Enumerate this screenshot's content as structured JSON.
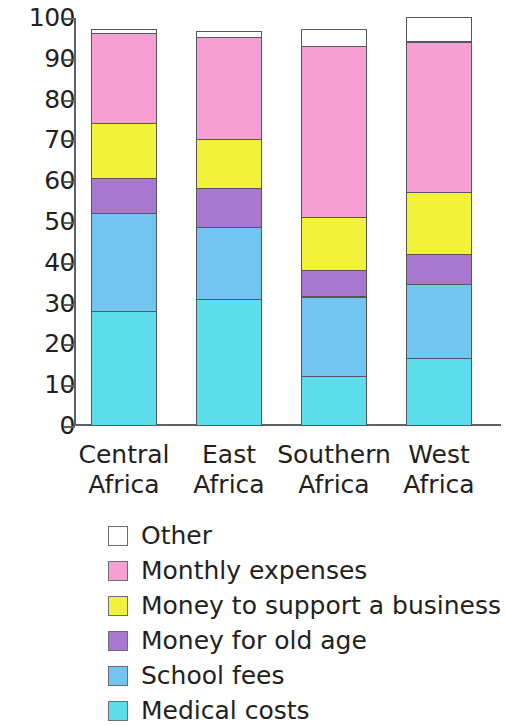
{
  "chart_data": {
    "type": "bar",
    "subtype": "stacked-bar",
    "title": "",
    "xlabel": "",
    "ylabel": "",
    "ylim": [
      0,
      100
    ],
    "yticks": [
      0,
      10,
      20,
      30,
      40,
      50,
      60,
      70,
      80,
      90,
      100
    ],
    "ytick_labels": [
      "0",
      "10",
      "20",
      "30",
      "40",
      "50",
      "60",
      "70",
      "80",
      "90",
      "100"
    ],
    "grid": false,
    "legend_position": "bottom",
    "categories": [
      "Central Africa",
      "East Africa",
      "Southern Africa",
      "West Africa"
    ],
    "category_lines": [
      [
        "Central",
        "Africa"
      ],
      [
        "East",
        "Africa"
      ],
      [
        "Southern",
        "Africa"
      ],
      [
        "West",
        "Africa"
      ]
    ],
    "stack_order_bottom_to_top": [
      "Medical costs",
      "School fees",
      "Money for old age",
      "Money to support a business",
      "Monthly expenses",
      "Other"
    ],
    "series": [
      {
        "name": "Medical costs",
        "color": "#5ddcec",
        "values": [
          28,
          31,
          12,
          16.5
        ]
      },
      {
        "name": "School fees",
        "color": "#72c5f0",
        "values": [
          24,
          17.5,
          19.5,
          18
        ]
      },
      {
        "name": "Money for old age",
        "color": "#a878d0",
        "values": [
          8.5,
          9.5,
          6.5,
          7.5
        ]
      },
      {
        "name": "Money to support a business",
        "color": "#f2f23c",
        "values": [
          13.5,
          12,
          13,
          15
        ]
      },
      {
        "name": "Monthly expenses",
        "color": "#f79fd4",
        "values": [
          22,
          25,
          42,
          37
        ]
      },
      {
        "name": "Other",
        "color": "#ffffff",
        "values": [
          1,
          1.5,
          4,
          6
        ]
      }
    ],
    "totals": [
      97,
      96.5,
      97,
      100
    ]
  },
  "legend": {
    "items": [
      {
        "label": "Other",
        "color": "#ffffff"
      },
      {
        "label": "Monthly expenses",
        "color": "#f79fd4"
      },
      {
        "label": "Money to support a business",
        "color": "#f2f23c"
      },
      {
        "label": "Money for old age",
        "color": "#a878d0"
      },
      {
        "label": "School fees",
        "color": "#72c5f0"
      },
      {
        "label": "Medical costs",
        "color": "#5ddcec"
      }
    ]
  },
  "axis": {
    "stroke": "#5b6167",
    "text_color": "#231f20"
  }
}
